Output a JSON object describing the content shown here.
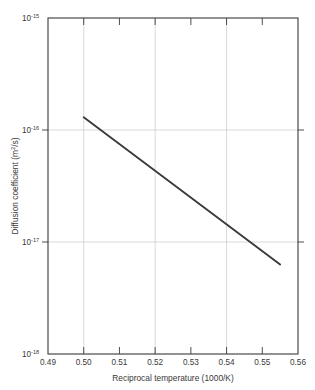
{
  "chart_data": {
    "type": "line",
    "title": "",
    "xlabel": "Reciprocal temperature (1000/K)",
    "ylabel": "Diffusion coefficient (m2/s)",
    "ylabel_base": "Diffusion coefficient (m",
    "ylabel_sup": "2",
    "ylabel_tail": "/s)",
    "xlim": [
      0.49,
      0.56
    ],
    "ylim": [
      1e-18,
      1e-15
    ],
    "yscale": "log",
    "xscale": "linear",
    "grid": true,
    "grid_axes": "both-major",
    "legend": "none",
    "xticks": [
      0.49,
      0.5,
      0.51,
      0.52,
      0.53,
      0.54,
      0.55,
      0.56
    ],
    "xtick_labels": [
      "0.49",
      "0.50",
      "0.51",
      "0.52",
      "0.53",
      "0.54",
      "0.55",
      "0.56"
    ],
    "yticks": [
      1e-18,
      1e-17,
      1e-16,
      1e-15
    ],
    "ytick_labels": [
      "10-18",
      "10-17",
      "10-16",
      "10-15"
    ],
    "ytick_base": "10",
    "ytick_exponents": [
      "-18",
      "-17",
      "-16",
      "-15"
    ],
    "x_gridlines": [
      0.5,
      0.52,
      0.54
    ],
    "y_gridlines": [
      1e-17,
      1e-16
    ],
    "series": [
      {
        "name": "Diffusion coefficient",
        "color": "#3b3b3b",
        "x": [
          0.5,
          0.555
        ],
        "y": [
          1.3e-16,
          6.3e-18
        ],
        "x_start": 0.5,
        "y_start": 1.3e-16,
        "x_end": 0.555,
        "y_end": 6.3e-18
      }
    ],
    "annotations": []
  },
  "colors": {
    "background": "#ffffff",
    "axis": "#3a3a3a",
    "grid": "#c8c8c8",
    "data": "#3b3b3b",
    "text": "#3a3a3a"
  }
}
